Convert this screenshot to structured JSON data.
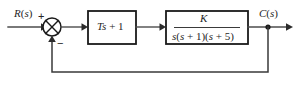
{
  "diagram": {
    "background_color": "#ffffff",
    "line_color": "#4d4d4d",
    "box_border_color": "#1a1a1a",
    "text_color": "#262626",
    "signals": {
      "input_label": "R(s)",
      "output_label": "C(s)"
    },
    "summing_junction": {
      "name": "summing-junction",
      "positive_sign": "+",
      "negative_sign": "−",
      "shape": "circle-with-cross"
    },
    "blocks": [
      {
        "id": "controller",
        "label": "Ts + 1",
        "label_parts": {
          "var1": "T",
          "var2": "s",
          "operator": "+",
          "constant": "1"
        }
      },
      {
        "id": "plant",
        "type": "fraction",
        "numerator": "K",
        "denominator": "s(s + 1)(s + 5)",
        "label": "K / s(s + 1)(s + 5)"
      }
    ],
    "feedback": {
      "path": "unity",
      "gain": "1",
      "sign": "negative",
      "takeoff_node": "output-takeoff-node"
    }
  }
}
